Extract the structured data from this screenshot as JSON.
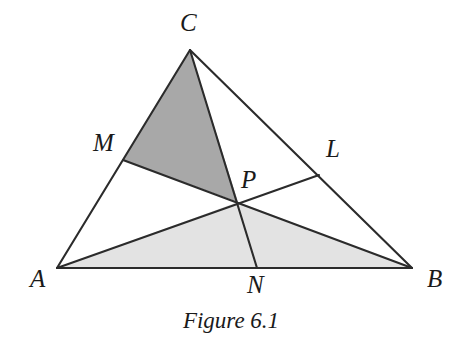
{
  "figure": {
    "caption": "Figure 6.1",
    "background_color": "#ffffff",
    "stroke_color": "#2b2b2b",
    "dark_fill": "#a8a8a8",
    "light_fill": "#e3e3e3",
    "label_color": "#1a1a1a"
  },
  "labels": {
    "A": "A",
    "B": "B",
    "C": "C",
    "M": "M",
    "N": "N",
    "L": "L",
    "P": "P"
  },
  "chart_data": {
    "type": "diagram",
    "title": "Figure 6.1",
    "points": {
      "A": [
        57,
        268
      ],
      "B": [
        412,
        268
      ],
      "C": [
        190,
        50
      ],
      "M": [
        123,
        160
      ],
      "N": [
        257,
        268
      ],
      "L": [
        319,
        175
      ],
      "P": [
        238,
        202
      ]
    },
    "label_positions": {
      "A": [
        30,
        266
      ],
      "B": [
        427,
        266
      ],
      "C": [
        180,
        10
      ],
      "M": [
        93,
        130
      ],
      "N": [
        247,
        272
      ],
      "L": [
        326,
        136
      ],
      "P": [
        241,
        167
      ]
    },
    "segments": [
      {
        "name": "AB",
        "from": "A",
        "to": "B"
      },
      {
        "name": "BC",
        "from": "B",
        "to": "C"
      },
      {
        "name": "CA",
        "from": "C",
        "to": "A"
      },
      {
        "name": "AL",
        "from": "A",
        "to": "L"
      },
      {
        "name": "BM",
        "from": "B",
        "to": "M"
      },
      {
        "name": "CN",
        "from": "C",
        "to": "N"
      }
    ],
    "shaded_regions": [
      {
        "name": "quadrilateral-AMPC",
        "vertices": [
          "A",
          "M",
          "P",
          "C"
        ],
        "fill": "#a8a8a8"
      },
      {
        "name": "triangle-APB",
        "vertices": [
          "A",
          "P",
          "B"
        ],
        "fill": "#e3e3e3"
      }
    ],
    "caption_position": [
      231,
      322
    ]
  }
}
